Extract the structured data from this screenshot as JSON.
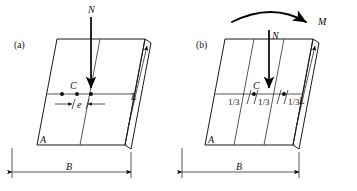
{
  "figure": {
    "background_color": "#ffffff",
    "line_color": "#1a1a1a",
    "type": "engineering-line-diagram"
  },
  "panels": [
    {
      "id": "a",
      "tag": "(a)",
      "labels": {
        "load": "N",
        "centroid": "C",
        "eccentricity": "e",
        "corner": "A",
        "length": "L",
        "width": "B"
      }
    },
    {
      "id": "b",
      "tag": "(b)",
      "labels": {
        "load": "N",
        "moment": "M",
        "centroid": "C",
        "corner": "A",
        "length": "L",
        "width": "B",
        "third_left": "1/3",
        "third_middle": "1/3",
        "third_right": "1/3"
      }
    }
  ],
  "annotations": {
    "load_arrow_name": "vertical-load-arrow",
    "moment_arrow_name": "curved-moment-arrow",
    "dim_width_name": "width-dimension",
    "dim_length_name": "length-dimension",
    "dim_ecc_name": "eccentricity-dimension"
  }
}
